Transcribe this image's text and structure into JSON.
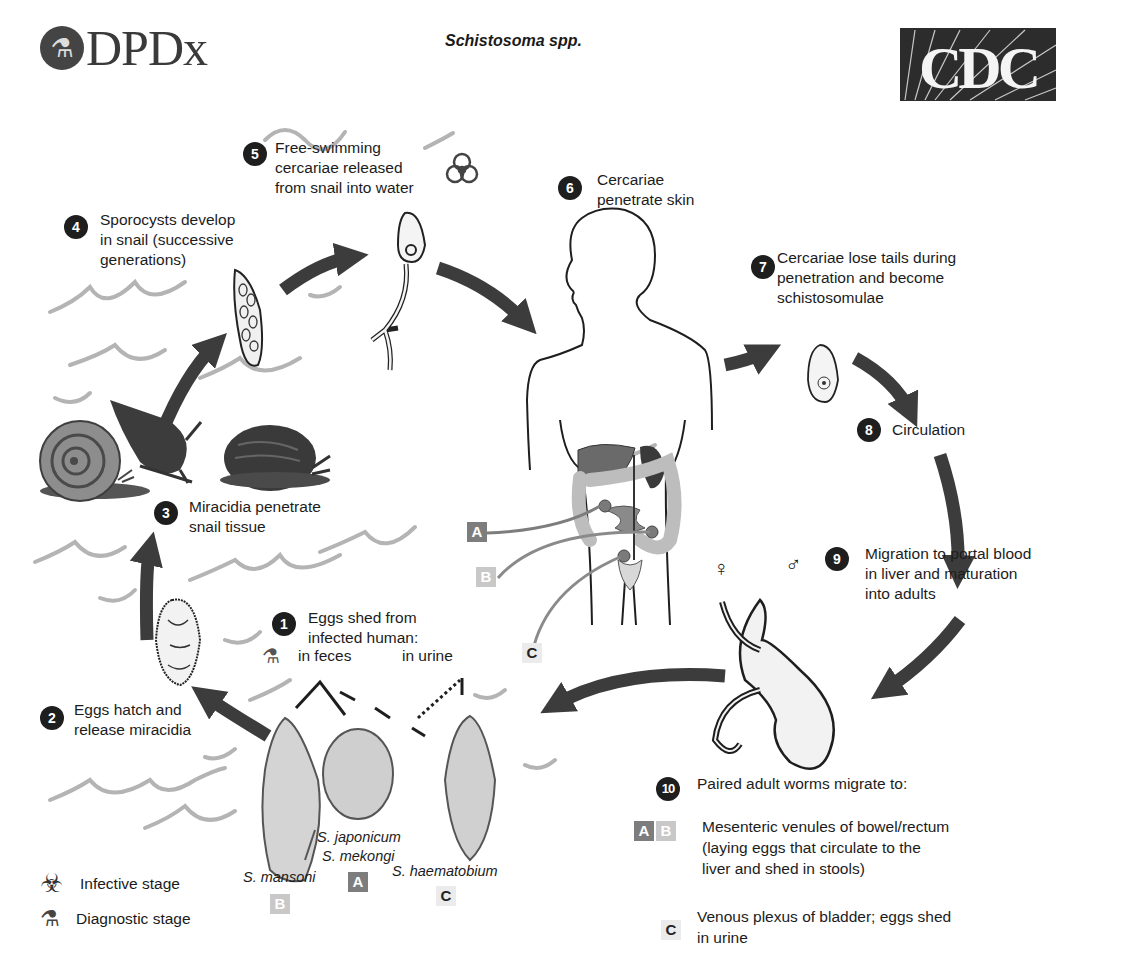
{
  "header": {
    "logo_left": {
      "name": "DPDx",
      "icon": "microscope-icon"
    },
    "title": "Schistosoma spp.",
    "logo_right": {
      "name": "CDC"
    }
  },
  "steps": [
    {
      "number": "1",
      "text": [
        "Eggs shed from",
        "infected human:"
      ]
    },
    {
      "number": "2",
      "text": [
        "Eggs hatch and",
        "release miracidia"
      ]
    },
    {
      "number": "3",
      "text": [
        "Miracidia penetrate",
        "snail tissue"
      ]
    },
    {
      "number": "4",
      "text": [
        "Sporocysts develop",
        "in snail (successive",
        "generations)"
      ]
    },
    {
      "number": "5",
      "text": [
        "Free-swimming",
        "cercariae released",
        "from snail into water"
      ],
      "icon": "biohazard-icon"
    },
    {
      "number": "6",
      "text": [
        "Cercariae",
        "penetrate skin"
      ]
    },
    {
      "number": "7",
      "text": [
        "Cercariae lose tails during",
        "penetration and become",
        "schistosomulae"
      ]
    },
    {
      "number": "8",
      "text": [
        "Circulation"
      ]
    },
    {
      "number": "9",
      "text": [
        "Migration to portal blood",
        "in liver and maturation",
        "into adults"
      ]
    },
    {
      "number": "10",
      "text": [
        "Paired  adult worms migrate to:"
      ]
    }
  ],
  "egg_sources": {
    "feces": "in feces",
    "urine": "in urine"
  },
  "species": [
    {
      "name": "S. mansoni",
      "badge": "B"
    },
    {
      "name": [
        "S. japonicum",
        "S. mekongi"
      ],
      "badge": "A"
    },
    {
      "name": "S. haematobium",
      "badge": "C"
    }
  ],
  "body_badges": [
    "A",
    "B",
    "C"
  ],
  "sex_symbols": {
    "female": "♀",
    "male": "♂"
  },
  "migration_targets": [
    {
      "badges": [
        "A",
        "B"
      ],
      "text": [
        "Mesenteric venules of bowel/rectum",
        "(laying eggs that circulate to the",
        "liver and shed in stools)"
      ]
    },
    {
      "badges": [
        "C"
      ],
      "text": [
        "Venous plexus of bladder; eggs shed",
        "in urine"
      ]
    }
  ],
  "legend": [
    {
      "icon": "biohazard-icon",
      "label": "Infective stage"
    },
    {
      "icon": "microscope-icon",
      "label": "Diagnostic stage"
    }
  ],
  "colors": {
    "badge_a": "#7d7d7d",
    "badge_b": "#c8c8c8",
    "badge_c": "#ebebeb",
    "arrow": "#3c3c3c",
    "water": "#b4b4b4",
    "step_badge": "#1e1e1e"
  }
}
